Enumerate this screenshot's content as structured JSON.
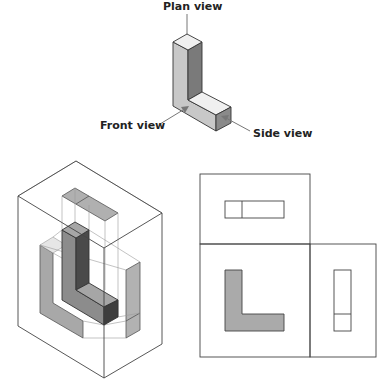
{
  "figure": {
    "labels": {
      "plan": "Plan view",
      "front": "Front view",
      "side": "Side view"
    },
    "colors": {
      "light_face": "#f0f0f0",
      "mid_face": "#c8c8c8",
      "dark_face": "#777777",
      "projection_fill": "#aaaaaa",
      "line": "#333333",
      "arrow": "#777777"
    },
    "panels": [
      {
        "name": "isometric-block",
        "description": "L-shaped block with arrows indicating viewing directions"
      },
      {
        "name": "projection-box",
        "description": "Block inside a glass box with views projected onto faces"
      },
      {
        "name": "unfolded-views",
        "description": "Plan, front and side views laid out flat"
      }
    ]
  }
}
